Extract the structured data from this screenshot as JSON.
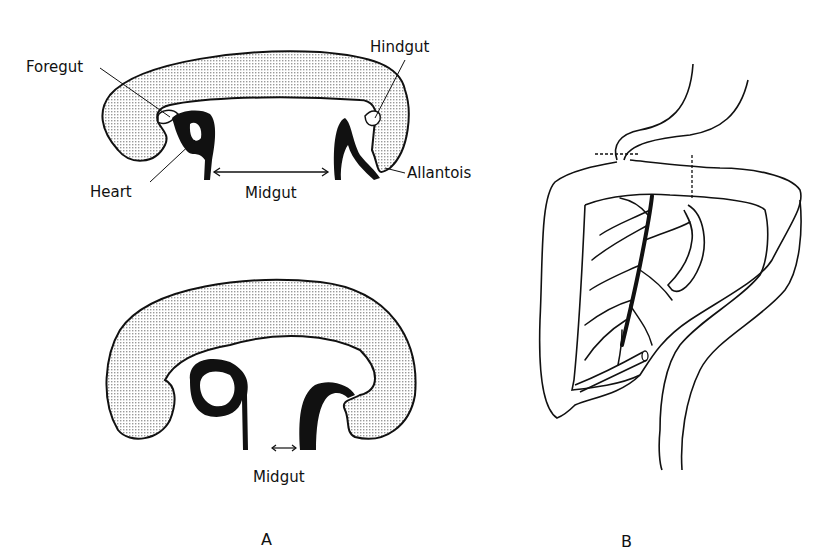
{
  "panel_a": {
    "label": "A",
    "top_figure": {
      "labels": {
        "foregut": "Foregut",
        "hindgut": "Hindgut",
        "heart": "Heart",
        "midgut": "Midgut",
        "allantois": "Allantois"
      }
    },
    "bottom_figure": {
      "labels": {
        "midgut": "Midgut"
      }
    }
  },
  "panel_b": {
    "label": "B"
  },
  "colors": {
    "stroke": "#111111",
    "stipple": "#cfcfcf",
    "background": "#ffffff"
  }
}
